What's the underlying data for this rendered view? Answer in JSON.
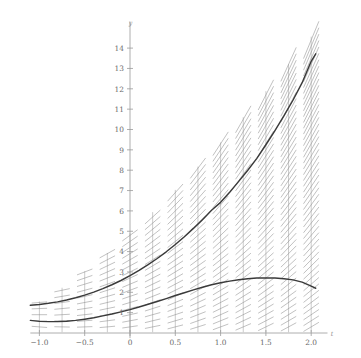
{
  "chart_data": {
    "type": "line",
    "title": "",
    "subtitle": "",
    "xlabel": "t",
    "ylabel": "y",
    "xlim": [
      -1.1,
      2.12
    ],
    "ylim": [
      -0.35,
      14.8
    ],
    "grid": false,
    "legend": "none",
    "background": "#ffffff",
    "axis_color": "#9a9a9a",
    "curve_color": "#3a3a3a",
    "slope_field_color": "#8e8e8e",
    "slope_field_stem_color": "#a0a0a0",
    "xticks": [
      -1.0,
      -0.75,
      -0.5,
      -0.25,
      0,
      0.25,
      0.5,
      0.75,
      1.0,
      1.25,
      1.5,
      1.75,
      2.0
    ],
    "xtick_labels": [
      "-1.0",
      "",
      "-0.5",
      "",
      "0",
      "",
      "0.5",
      "",
      "1.0",
      "",
      "1.5",
      "",
      "2.0"
    ],
    "yticks": [
      1,
      2,
      3,
      4,
      5,
      6,
      7,
      8,
      9,
      10,
      11,
      12,
      13,
      14
    ],
    "ytick_labels": [
      "1",
      "2",
      "3",
      "4",
      "5",
      "6",
      "7",
      "8",
      "9",
      "10",
      "11",
      "12",
      "13",
      "14"
    ],
    "slope_field": {
      "description": "direction field of dy/dt plotted on vertical stems",
      "t_columns": [
        -1.0,
        -0.75,
        -0.5,
        -0.25,
        0,
        0.25,
        0.5,
        0.75,
        1.0,
        1.25,
        1.5,
        1.75,
        2.0
      ],
      "y_spacing": 0.3,
      "segment_half_length": 0.085,
      "slope_formula_a": 1.0,
      "slope_formula_b": 0.62
    },
    "series": [
      {
        "name": "upper solution curve",
        "x": [
          -1.1,
          -1.0,
          -0.9,
          -0.8,
          -0.7,
          -0.6,
          -0.5,
          -0.4,
          -0.3,
          -0.2,
          -0.1,
          0.0,
          0.1,
          0.2,
          0.3,
          0.4,
          0.5,
          0.6,
          0.7,
          0.8,
          0.9,
          1.0,
          1.1,
          1.2,
          1.3,
          1.4,
          1.5,
          1.6,
          1.7,
          1.8,
          1.9,
          2.0,
          2.05
        ],
        "values": [
          1.36,
          1.4,
          1.46,
          1.53,
          1.62,
          1.73,
          1.86,
          2.01,
          2.18,
          2.37,
          2.58,
          2.82,
          3.08,
          3.36,
          3.66,
          3.99,
          4.35,
          4.73,
          5.14,
          5.57,
          6.03,
          6.42,
          6.92,
          7.45,
          8.0,
          8.58,
          9.25,
          9.95,
          10.68,
          11.45,
          12.3,
          13.35,
          13.72
        ]
      },
      {
        "name": "lower solution curve",
        "x": [
          -1.1,
          -1.0,
          -0.9,
          -0.8,
          -0.7,
          -0.6,
          -0.5,
          -0.4,
          -0.3,
          -0.2,
          -0.1,
          0.0,
          0.1,
          0.2,
          0.3,
          0.4,
          0.5,
          0.6,
          0.7,
          0.8,
          0.9,
          1.0,
          1.1,
          1.2,
          1.3,
          1.4,
          1.5,
          1.6,
          1.7,
          1.8,
          1.9,
          2.0,
          2.05
        ],
        "values": [
          0.62,
          0.57,
          0.56,
          0.56,
          0.58,
          0.62,
          0.68,
          0.75,
          0.84,
          0.93,
          1.04,
          1.15,
          1.28,
          1.41,
          1.55,
          1.69,
          1.84,
          1.98,
          2.12,
          2.25,
          2.37,
          2.47,
          2.55,
          2.62,
          2.67,
          2.7,
          2.71,
          2.7,
          2.67,
          2.61,
          2.5,
          2.3,
          2.2
        ]
      }
    ]
  },
  "axis_labels": {
    "x_axis_name": "t",
    "y_axis_name": "y"
  }
}
